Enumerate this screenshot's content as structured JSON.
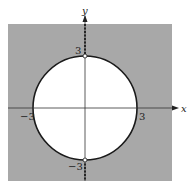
{
  "figure": {
    "colors": {
      "shaded": "#a8a8a8",
      "circle": "#1a1a1a",
      "background": "#ffffff"
    },
    "axes": {
      "x_label": "x",
      "y_label": "y"
    },
    "tick_labels": {
      "y_top": "3",
      "y_bottom": "−3",
      "x_left": "−3",
      "x_right": "3"
    },
    "circle": {
      "center": [
        0,
        0
      ],
      "radius": 3
    },
    "open_points": [
      [
        0,
        3
      ],
      [
        0,
        -3
      ]
    ]
  }
}
